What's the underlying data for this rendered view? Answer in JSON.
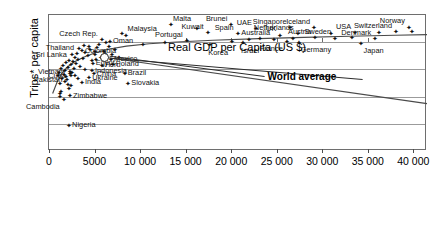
{
  "chart_data": {
    "type": "scatter",
    "title": "",
    "xlabel": "Real GDP per Capita (US $)",
    "ylabel": "Trips* per capita",
    "xlim": [
      0,
      41500
    ],
    "ylim": [
      0.0001,
      10
    ],
    "yscale": "log",
    "xscale": "linear",
    "grid": true,
    "legend": "none",
    "yticks": [
      "10",
      "1",
      "0.1",
      "0.01",
      "0.001",
      "0.0001"
    ],
    "ytick_values": [
      10,
      1,
      0.1,
      0.01,
      0.001,
      0.0001
    ],
    "xticks": [
      "0",
      "5000",
      "10 000",
      "15 000",
      "20 000",
      "25 000",
      "30 000",
      "35 000",
      "40 000"
    ],
    "xtick_values": [
      0,
      5000,
      10000,
      15000,
      20000,
      25000,
      30000,
      35000,
      40000
    ],
    "annotations": [
      {
        "label": "World average",
        "x": 24000,
        "y": 0.055,
        "target_x": 6100,
        "target_y": 0.28
      }
    ],
    "points": [
      {
        "label": "Malta",
        "x": 13300,
        "y": 4.3,
        "pos": "tr"
      },
      {
        "label": "Brunei",
        "x": 19900,
        "y": 4.1,
        "pos": "tl"
      },
      {
        "label": "UAE",
        "x": 22600,
        "y": 3.05,
        "pos": "tl"
      },
      {
        "label": "Singapore",
        "x": 26400,
        "y": 3.3,
        "pos": "tl"
      },
      {
        "label": "Iceland",
        "x": 29000,
        "y": 3.25,
        "pos": "tl"
      },
      {
        "label": "Norway",
        "x": 39400,
        "y": 3.4,
        "pos": "tl"
      },
      {
        "label": "Switzerland",
        "x": 38000,
        "y": 2.3,
        "pos": "tl"
      },
      {
        "label": "USA",
        "x": 33500,
        "y": 2.1,
        "pos": "tl"
      },
      {
        "label": "Kuwait",
        "x": 17300,
        "y": 2.1,
        "pos": "tl"
      },
      {
        "label": "Spain",
        "x": 20600,
        "y": 1.95,
        "pos": "tl"
      },
      {
        "label": "UK",
        "x": 25300,
        "y": 1.75,
        "pos": "tl"
      },
      {
        "label": "Netherlands",
        "x": 27200,
        "y": 1.95,
        "pos": "tl"
      },
      {
        "label": "Denmark",
        "x": 35700,
        "y": 1.3,
        "pos": "tl"
      },
      {
        "label": "Sweden",
        "x": 31300,
        "y": 1.35,
        "pos": "tl"
      },
      {
        "label": "Austria",
        "x": 29100,
        "y": 1.4,
        "pos": "tl"
      },
      {
        "label": "Australia",
        "x": 24600,
        "y": 1.22,
        "pos": "tl"
      },
      {
        "label": "Germany",
        "x": 27300,
        "y": 0.97,
        "pos": "br"
      },
      {
        "label": "France",
        "x": 26000,
        "y": 1.0,
        "pos": "bl"
      },
      {
        "label": "Japan",
        "x": 34200,
        "y": 0.86,
        "pos": "br"
      },
      {
        "label": "Israel",
        "x": 21200,
        "y": 0.93,
        "pos": "b"
      },
      {
        "label": "Korea",
        "x": 17600,
        "y": 0.78,
        "pos": "b"
      },
      {
        "label": "Portugal",
        "x": 15000,
        "y": 1.1,
        "pos": "tl"
      },
      {
        "label": "Malaysia",
        "x": 8300,
        "y": 1.7,
        "pos": "tr"
      },
      {
        "label": "Oman",
        "x": 6600,
        "y": 1.05,
        "pos": "r"
      },
      {
        "label": "Czech Rep.",
        "x": 5700,
        "y": 1.15,
        "pos": "tl"
      },
      {
        "label": "Thailand",
        "x": 3200,
        "y": 0.58,
        "pos": "l"
      },
      {
        "label": "Colombia",
        "x": 3500,
        "y": 0.47,
        "pos": "r"
      },
      {
        "label": "Sri Lanka",
        "x": 2400,
        "y": 0.33,
        "pos": "l"
      },
      {
        "label": "Mexico",
        "x": 6700,
        "y": 0.23,
        "pos": "r"
      },
      {
        "label": "Poland",
        "x": 6900,
        "y": 0.15,
        "pos": "r"
      },
      {
        "label": "Egypt",
        "x": 4700,
        "y": 0.16,
        "pos": "r"
      },
      {
        "label": "Peru",
        "x": 5700,
        "y": 0.135,
        "pos": "r"
      },
      {
        "label": "Indonesia",
        "x": 4600,
        "y": 0.085,
        "pos": "r"
      },
      {
        "label": "China",
        "x": 4800,
        "y": 0.068,
        "pos": "r"
      },
      {
        "label": "Ukraine",
        "x": 4300,
        "y": 0.048,
        "pos": "r"
      },
      {
        "label": "India",
        "x": 3500,
        "y": 0.032,
        "pos": "r"
      },
      {
        "label": "Brazil",
        "x": 8200,
        "y": 0.069,
        "pos": "r"
      },
      {
        "label": "Slovakia",
        "x": 8600,
        "y": 0.03,
        "pos": "r"
      },
      {
        "label": "Vietnam",
        "x": 2200,
        "y": 0.077,
        "pos": "l"
      },
      {
        "label": "Cuba",
        "x": 2300,
        "y": 0.056,
        "pos": "l"
      },
      {
        "label": "Pakistan",
        "x": 1900,
        "y": 0.04,
        "pos": "l"
      },
      {
        "label": "Zimbabwe",
        "x": 2200,
        "y": 0.0105,
        "pos": "r"
      },
      {
        "label": "Cambodia",
        "x": 1500,
        "y": 0.0075,
        "pos": "bl"
      },
      {
        "label": "Nigeria",
        "x": 2100,
        "y": 0.00085,
        "pos": "r"
      },
      {
        "label": "",
        "x": 7900,
        "y": 2.05,
        "pos": "nolabel"
      },
      {
        "label": "",
        "x": 16100,
        "y": 3.05,
        "pos": "nolabel"
      },
      {
        "label": "",
        "x": 30900,
        "y": 2.0,
        "pos": "nolabel"
      },
      {
        "label": "",
        "x": 23100,
        "y": 1.35,
        "pos": "nolabel"
      },
      {
        "label": "",
        "x": 26700,
        "y": 1.3,
        "pos": "nolabel"
      },
      {
        "label": "",
        "x": 21800,
        "y": 1.22,
        "pos": "nolabel"
      },
      {
        "label": "",
        "x": 20000,
        "y": 1.0,
        "pos": "nolabel"
      },
      {
        "label": "",
        "x": 33200,
        "y": 1.45,
        "pos": "nolabel"
      },
      {
        "label": "",
        "x": 36100,
        "y": 2.1,
        "pos": "nolabel"
      },
      {
        "label": "",
        "x": 39800,
        "y": 2.45,
        "pos": "nolabel"
      },
      {
        "label": "",
        "x": 12600,
        "y": 0.95,
        "pos": "nolabel"
      },
      {
        "label": "",
        "x": 10200,
        "y": 0.8,
        "pos": "nolabel"
      },
      {
        "label": "",
        "x": 6200,
        "y": 0.95,
        "pos": "nolabel"
      },
      {
        "label": "",
        "x": 5200,
        "y": 0.62,
        "pos": "nolabel"
      },
      {
        "label": "",
        "x": 4400,
        "y": 0.52,
        "pos": "nolabel"
      },
      {
        "label": "",
        "x": 3900,
        "y": 0.4,
        "pos": "nolabel"
      },
      {
        "label": "",
        "x": 4200,
        "y": 0.3,
        "pos": "nolabel"
      },
      {
        "label": "",
        "x": 5000,
        "y": 0.34,
        "pos": "nolabel"
      },
      {
        "label": "",
        "x": 5600,
        "y": 0.27,
        "pos": "nolabel"
      },
      {
        "label": "",
        "x": 6000,
        "y": 0.36,
        "pos": "nolabel"
      },
      {
        "label": "",
        "x": 3000,
        "y": 0.36,
        "pos": "nolabel"
      },
      {
        "label": "",
        "x": 2700,
        "y": 0.26,
        "pos": "nolabel"
      },
      {
        "label": "",
        "x": 2500,
        "y": 0.19,
        "pos": "nolabel"
      },
      {
        "label": "",
        "x": 3100,
        "y": 0.22,
        "pos": "nolabel"
      },
      {
        "label": "",
        "x": 3600,
        "y": 0.25,
        "pos": "nolabel"
      },
      {
        "label": "",
        "x": 2900,
        "y": 0.16,
        "pos": "nolabel"
      },
      {
        "label": "",
        "x": 2300,
        "y": 0.145,
        "pos": "nolabel"
      },
      {
        "label": "",
        "x": 2000,
        "y": 0.115,
        "pos": "nolabel"
      },
      {
        "label": "",
        "x": 2600,
        "y": 0.105,
        "pos": "nolabel"
      },
      {
        "label": "",
        "x": 3300,
        "y": 0.12,
        "pos": "nolabel"
      },
      {
        "label": "",
        "x": 3800,
        "y": 0.095,
        "pos": "nolabel"
      },
      {
        "label": "",
        "x": 1700,
        "y": 0.09,
        "pos": "nolabel"
      },
      {
        "label": "",
        "x": 1500,
        "y": 0.062,
        "pos": "nolabel"
      },
      {
        "label": "",
        "x": 1800,
        "y": 0.052,
        "pos": "nolabel"
      },
      {
        "label": "",
        "x": 2150,
        "y": 0.065,
        "pos": "nolabel"
      },
      {
        "label": "",
        "x": 2450,
        "y": 0.072,
        "pos": "nolabel"
      },
      {
        "label": "",
        "x": 2750,
        "y": 0.058,
        "pos": "nolabel"
      },
      {
        "label": "",
        "x": 3050,
        "y": 0.045,
        "pos": "nolabel"
      },
      {
        "label": "",
        "x": 1300,
        "y": 0.043,
        "pos": "nolabel"
      },
      {
        "label": "",
        "x": 1100,
        "y": 0.03,
        "pos": "nolabel"
      },
      {
        "label": "",
        "x": 1600,
        "y": 0.034,
        "pos": "nolabel"
      },
      {
        "label": "",
        "x": 1950,
        "y": 0.026,
        "pos": "nolabel"
      },
      {
        "label": "",
        "x": 2350,
        "y": 0.024,
        "pos": "nolabel"
      },
      {
        "label": "",
        "x": 900,
        "y": 0.055,
        "pos": "nolabel"
      },
      {
        "label": "",
        "x": 1000,
        "y": 0.075,
        "pos": "nolabel"
      },
      {
        "label": "",
        "x": 1200,
        "y": 0.105,
        "pos": "nolabel"
      },
      {
        "label": "",
        "x": 1400,
        "y": 0.135,
        "pos": "nolabel"
      },
      {
        "label": "",
        "x": 1750,
        "y": 0.165,
        "pos": "nolabel"
      },
      {
        "label": "",
        "x": 2100,
        "y": 0.21,
        "pos": "nolabel"
      },
      {
        "label": "",
        "x": 4900,
        "y": 0.44,
        "pos": "nolabel"
      },
      {
        "label": "",
        "x": 4300,
        "y": 0.66,
        "pos": "nolabel"
      },
      {
        "label": "",
        "x": 3700,
        "y": 0.72,
        "pos": "nolabel"
      },
      {
        "label": "",
        "x": 5400,
        "y": 0.8,
        "pos": "nolabel"
      },
      {
        "label": "",
        "x": 6500,
        "y": 0.68,
        "pos": "nolabel"
      },
      {
        "label": "",
        "x": 7100,
        "y": 0.52,
        "pos": "nolabel"
      },
      {
        "label": "",
        "x": 5900,
        "y": 0.43,
        "pos": "nolabel"
      },
      {
        "label": "",
        "x": 6800,
        "y": 0.34,
        "pos": "nolabel"
      },
      {
        "label": "",
        "x": 7600,
        "y": 0.27,
        "pos": "nolabel"
      },
      {
        "label": "",
        "x": 4600,
        "y": 0.195,
        "pos": "nolabel"
      },
      {
        "label": "",
        "x": 5100,
        "y": 0.215,
        "pos": "nolabel"
      },
      {
        "label": "",
        "x": 2050,
        "y": 0.019,
        "pos": "nolabel"
      },
      {
        "label": "",
        "x": 1250,
        "y": 0.0145,
        "pos": "nolabel"
      },
      {
        "label": "",
        "x": 1050,
        "y": 0.0095,
        "pos": "nolabel"
      },
      {
        "label": "",
        "x": 1150,
        "y": 0.0125,
        "pos": "nolabel"
      }
    ],
    "trend_curve": {
      "description": "fitted rising curve flattening at high GDP",
      "points": [
        [
          400,
          0.013
        ],
        [
          900,
          0.035
        ],
        [
          1400,
          0.07
        ],
        [
          2000,
          0.12
        ],
        [
          2800,
          0.19
        ],
        [
          3800,
          0.28
        ],
        [
          5000,
          0.4
        ],
        [
          6500,
          0.55
        ],
        [
          8500,
          0.72
        ],
        [
          11000,
          0.88
        ],
        [
          14000,
          1.02
        ],
        [
          18000,
          1.18
        ],
        [
          23000,
          1.35
        ],
        [
          28000,
          1.5
        ],
        [
          33000,
          1.65
        ],
        [
          38000,
          1.8
        ],
        [
          41500,
          1.9
        ]
      ]
    },
    "secondary_line": {
      "description": "straight descending line from world-average marker toward lower right",
      "points": [
        [
          6100,
          0.28
        ],
        [
          41500,
          0.0055
        ]
      ]
    }
  }
}
